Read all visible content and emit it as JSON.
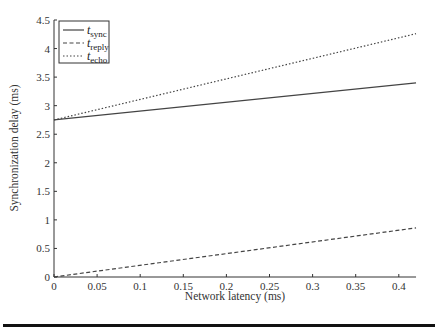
{
  "chart_data": {
    "type": "line",
    "title": "",
    "xlabel": "Network latency (ms)",
    "ylabel": "Synchronization delay (ms)",
    "xlim": [
      0,
      0.42
    ],
    "ylim": [
      0,
      4.5
    ],
    "grid": false,
    "legend_position": "upper left",
    "x_ticks": [
      0,
      0.05,
      0.1,
      0.15,
      0.2,
      0.25,
      0.3,
      0.35,
      0.4
    ],
    "x_tick_labels": [
      "0",
      "0.05",
      "0.1",
      "0.15",
      "0.2",
      "0.25",
      "0.3",
      "0.35",
      "0.4"
    ],
    "y_ticks": [
      0,
      0.5,
      1,
      1.5,
      2,
      2.5,
      3,
      3.5,
      4,
      4.5
    ],
    "y_tick_labels": [
      "0",
      "0.5",
      "1",
      "1.5",
      "2",
      "2.5",
      "3",
      "3.5",
      "4",
      "4.5"
    ],
    "x": [
      0,
      0.42
    ],
    "series": [
      {
        "name": "t_sync",
        "label_main": "t",
        "label_sub": "sync",
        "style": "solid",
        "values": [
          2.75,
          3.4
        ]
      },
      {
        "name": "t_reply",
        "label_main": "t",
        "label_sub": "reply",
        "style": "dashed",
        "values": [
          0,
          0.86
        ]
      },
      {
        "name": "t_echo",
        "label_main": "t",
        "label_sub": "echo",
        "style": "dotted",
        "values": [
          2.75,
          4.26
        ]
      }
    ]
  }
}
